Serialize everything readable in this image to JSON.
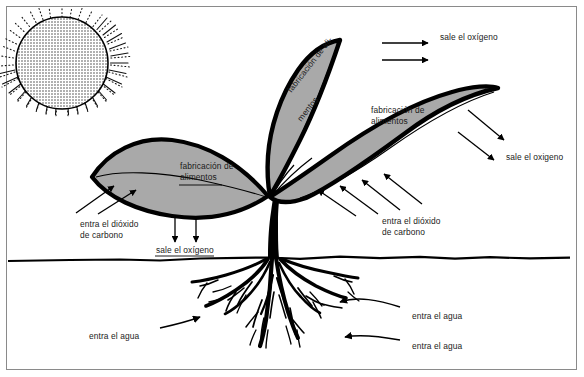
{
  "diagram": {
    "language": "es",
    "colors": {
      "leaf_fill": "#a9a9a9",
      "outline": "#000000",
      "background": "#ffffff",
      "frame_border": "#8a8a8a",
      "sun_fill": "#c9c9c9"
    }
  },
  "labels": [
    {
      "id": "sale-oxigeno-top",
      "text": "sale el oxígeno",
      "x": 440,
      "y": 37,
      "rotate": 0
    },
    {
      "id": "fabricacion-centro-1",
      "text": "fabricación de ali-",
      "x": 285,
      "y": 88,
      "rotate": -52
    },
    {
      "id": "fabricacion-centro-2",
      "text": "mentos",
      "x": 293,
      "y": 116,
      "rotate": -52
    },
    {
      "id": "fabricacion-derecha-1",
      "text": "fabricación de",
      "x": 371,
      "y": 110,
      "rotate": 0
    },
    {
      "id": "fabricacion-derecha-2",
      "text": "alimentos",
      "x": 371,
      "y": 121,
      "rotate": 0
    },
    {
      "id": "fabricacion-izq-1",
      "text": "fabricación de",
      "x": 180,
      "y": 166,
      "rotate": 0
    },
    {
      "id": "fabricacion-izq-2",
      "text": "alimentos",
      "x": 180,
      "y": 177,
      "rotate": 0
    },
    {
      "id": "sale-oxigeno-derecha",
      "text": "sale el oxigeno",
      "x": 506,
      "y": 156,
      "rotate": 0
    },
    {
      "id": "entra-co2-izq-1",
      "text": "entra el dióxido",
      "x": 80,
      "y": 224,
      "rotate": 0
    },
    {
      "id": "entra-co2-izq-2",
      "text": "de carbono",
      "x": 80,
      "y": 235,
      "rotate": 0
    },
    {
      "id": "sale-oxigeno-abajo",
      "text": "sale el oxígeno",
      "x": 156,
      "y": 249,
      "rotate": 0
    },
    {
      "id": "entra-co2-der-1",
      "text": "entra el dióxido",
      "x": 382,
      "y": 221,
      "rotate": 0
    },
    {
      "id": "entra-co2-der-2",
      "text": "de carbono",
      "x": 382,
      "y": 232,
      "rotate": 0
    },
    {
      "id": "entra-agua-izq",
      "text": "entra el agua",
      "x": 89,
      "y": 335,
      "rotate": 0
    },
    {
      "id": "entra-agua-der-1",
      "text": "entra el agua",
      "x": 412,
      "y": 315,
      "rotate": 0
    },
    {
      "id": "entra-agua-der-2",
      "text": "entra el agua",
      "x": 412,
      "y": 345,
      "rotate": 0
    }
  ],
  "elements": {
    "sun": {
      "name": "sun",
      "cx": 62,
      "cy": 63,
      "r": 46
    },
    "ground_line_y": 258,
    "leaves": [
      {
        "name": "leaf-left",
        "label": "fabricación de alimentos"
      },
      {
        "name": "leaf-center-upper",
        "label": "fabricación de ali-mentos"
      },
      {
        "name": "leaf-right",
        "label": "fabricación de alimentos"
      }
    ],
    "arrows": [
      {
        "name": "arrow-oxygen-top-1",
        "direction": "right"
      },
      {
        "name": "arrow-oxygen-top-2",
        "direction": "right"
      },
      {
        "name": "arrow-oxygen-right-1",
        "direction": "down-right"
      },
      {
        "name": "arrow-oxygen-right-2",
        "direction": "down-right"
      },
      {
        "name": "arrow-co2-left-1",
        "direction": "up-right"
      },
      {
        "name": "arrow-co2-left-2",
        "direction": "up-right"
      },
      {
        "name": "arrow-oxygen-down-1",
        "direction": "down"
      },
      {
        "name": "arrow-oxygen-down-2",
        "direction": "down"
      },
      {
        "name": "arrow-co2-right-1",
        "direction": "up-left"
      },
      {
        "name": "arrow-co2-right-2",
        "direction": "up-left"
      },
      {
        "name": "arrow-co2-right-3",
        "direction": "up-left"
      },
      {
        "name": "arrow-co2-right-4",
        "direction": "up-left"
      },
      {
        "name": "arrow-water-left",
        "direction": "right"
      },
      {
        "name": "arrow-water-right-1",
        "direction": "left"
      },
      {
        "name": "arrow-water-right-2",
        "direction": "left"
      }
    ]
  }
}
